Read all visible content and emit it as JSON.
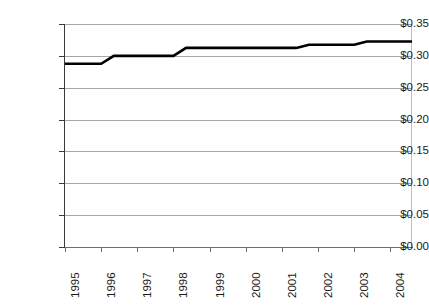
{
  "chart_data": {
    "type": "line",
    "title": "",
    "subtitle": "",
    "xlabel": "",
    "ylabel": "",
    "legend": [],
    "grid": true,
    "gridlines": "horizontal",
    "xlim": [
      1995,
      2004.6
    ],
    "ylim": [
      0.0,
      0.35
    ],
    "ytick_step": 0.05,
    "ytick_format": "$0.00",
    "x_tick_label_rotation": -90,
    "categories": [
      "1995",
      "1996",
      "1997",
      "1998",
      "1999",
      "2000",
      "2001",
      "2002",
      "2003",
      "2004"
    ],
    "x": [
      1995,
      1996,
      1997,
      1998,
      1999,
      2000,
      2001,
      2002,
      2003,
      2004
    ],
    "ytick_labels": [
      "$0.00",
      "$0.05",
      "$0.10",
      "$0.15",
      "$0.20",
      "$0.25",
      "$0.30",
      "$0.35"
    ],
    "ytick_values": [
      0.0,
      0.05,
      0.1,
      0.15,
      0.2,
      0.25,
      0.3,
      0.35
    ],
    "series": [
      {
        "name": "",
        "color": "#000000",
        "line_width": 2.6,
        "values": [
          0.2875,
          0.2875,
          0.3,
          0.3,
          0.3125,
          0.3125,
          0.3125,
          0.3175,
          0.3175,
          0.3225
        ],
        "points": [
          {
            "x": 1995.0,
            "y": 0.2875
          },
          {
            "x": 1996.0,
            "y": 0.2875
          },
          {
            "x": 1996.35,
            "y": 0.3
          },
          {
            "x": 1998.0,
            "y": 0.3
          },
          {
            "x": 1998.35,
            "y": 0.3125
          },
          {
            "x": 2001.4,
            "y": 0.3125
          },
          {
            "x": 2001.75,
            "y": 0.3175
          },
          {
            "x": 2003.0,
            "y": 0.3175
          },
          {
            "x": 2003.35,
            "y": 0.3225
          },
          {
            "x": 2004.6,
            "y": 0.3225
          }
        ]
      }
    ],
    "annotations": []
  },
  "colors": {
    "background": "#ffffff",
    "plot_background": "#ffffff",
    "gridline": "#a6a6a6",
    "axis": "#3a3a3a",
    "series_line": "#000000",
    "tick_label": "#1a1a1a"
  }
}
